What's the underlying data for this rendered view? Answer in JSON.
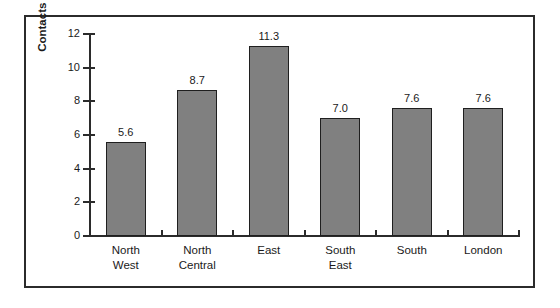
{
  "chart_data": {
    "type": "bar",
    "title": "",
    "xlabel": "",
    "ylabel": "Contacts per initial contact",
    "categories": [
      "North\nWest",
      "North\nCentral",
      "East",
      "South\nEast",
      "South",
      "London"
    ],
    "values": [
      5.6,
      8.7,
      11.3,
      7.0,
      7.6,
      7.6
    ],
    "value_labels": [
      "5.6",
      "8.7",
      "11.3",
      "7.0",
      "7.6",
      "7.6"
    ],
    "ylim": [
      0,
      12
    ],
    "ytick_labels": [
      "0",
      "2",
      "4",
      "6",
      "8",
      "10",
      "12"
    ],
    "ytick_values": [
      0,
      2,
      4,
      6,
      8,
      10,
      12
    ],
    "grid": false,
    "legend": null,
    "bar_color": "#808080",
    "bar_edge_color": "#1f1f1f",
    "axis_color": "#2b2b2b",
    "frame_color": "#2b2b2b",
    "background_color": "#ffffff"
  }
}
